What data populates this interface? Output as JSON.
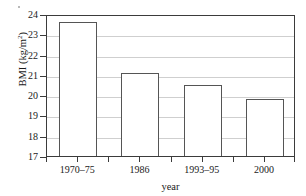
{
  "chart_data": {
    "type": "bar",
    "title": "",
    "subtitle": "",
    "categories": [
      "1970–75",
      "1986",
      "1993–95",
      "2000"
    ],
    "values": [
      23.6,
      21.1,
      20.5,
      19.8
    ],
    "series": [
      {
        "name": "BMI",
        "values": [
          23.6,
          21.1,
          20.5,
          19.8
        ]
      }
    ],
    "xlabel": "year",
    "ylabel": "BMI (kg/m",
    "ylabel_superscript": "2",
    "ylabel_suffix": ")",
    "ylabel_full": "BMI (kg/m2)",
    "ylim": [
      17,
      24
    ],
    "ytick_labels": [
      "24",
      "23",
      "22",
      "21",
      "20",
      "19",
      "18",
      "17"
    ],
    "ytick_values": [
      24,
      23,
      22,
      21,
      20,
      19,
      18,
      17
    ],
    "grid": true,
    "grid_axis": "y",
    "legend": false,
    "legend_position": "none",
    "bar_fill_color": "#ffffff",
    "bar_edge_color": "#555555",
    "grid_color": "#cfcfcf",
    "axis_color": "#3b3b3b",
    "background_color": "#ffffff"
  },
  "figure": {
    "axis_frame": true
  }
}
